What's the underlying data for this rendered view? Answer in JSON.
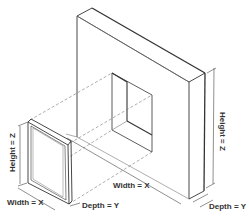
{
  "diagram": {
    "type": "isometric-dimension-diagram",
    "labels": {
      "window_height": "Height = Z",
      "window_width": "Width = X",
      "window_depth": "Depth = Y",
      "wall_height": "Height = Z",
      "wall_width": "Width = X",
      "wall_depth": "Depth = Y"
    },
    "colors": {
      "line": "#333333",
      "thin_line": "#777777",
      "background": "#ffffff"
    }
  }
}
